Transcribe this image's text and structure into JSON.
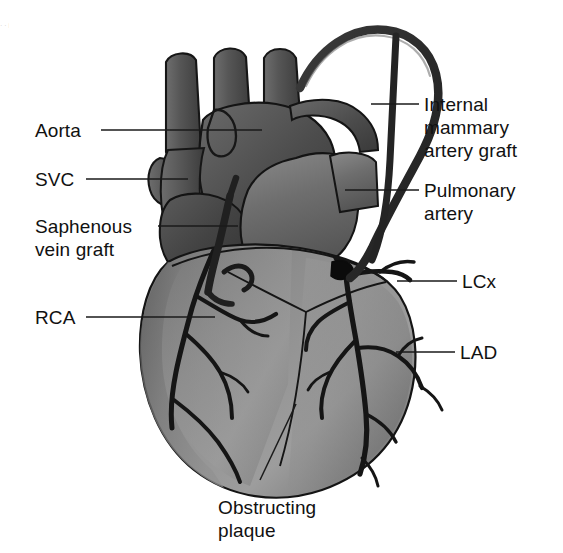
{
  "figure": {
    "kind": "medical-anatomical-diagram",
    "background_color": "#ffffff",
    "ink_color": "#111111",
    "palette": {
      "great_vessel_dark": "#4f4f4f",
      "great_vessel_mid": "#5e5e5e",
      "atrium_dark": "#444444",
      "pulmonary_artery": "#6d6d6d",
      "ventricle_light": "#9a9a9a",
      "ventricle_mid": "#8a8a8a",
      "ventricle_shadow": "#6f6f6f",
      "coronary_vessel": "#1b1b1b",
      "graft_vessel": "#2a2a2a",
      "plaque_marker": "#0d0d0d",
      "outline": "#141414"
    }
  },
  "labels": {
    "aorta": {
      "text": "Aorta",
      "side": "left"
    },
    "svc": {
      "text": "SVC",
      "side": "left"
    },
    "saphenous_line1": {
      "text": "Saphenous",
      "side": "left"
    },
    "saphenous_line2": {
      "text": "vein graft",
      "side": "left"
    },
    "rca": {
      "text": "RCA",
      "side": "left"
    },
    "ima_line1": {
      "text": "Internal",
      "side": "right"
    },
    "ima_line2": {
      "text": "mammary",
      "side": "right"
    },
    "ima_line3": {
      "text": "artery graft",
      "side": "right"
    },
    "pulmonary_line1": {
      "text": "Pulmonary",
      "side": "right"
    },
    "pulmonary_line2": {
      "text": "artery",
      "side": "right"
    },
    "lcx": {
      "text": "LCx",
      "side": "right"
    },
    "lad": {
      "text": "LAD",
      "side": "right"
    },
    "plaque_line1": {
      "text": "Obstructing",
      "side": "bottom"
    },
    "plaque_line2": {
      "text": "plaque",
      "side": "bottom"
    }
  },
  "edge_artifact": {
    "text": "· · i · · · i · · · i · · ·"
  }
}
